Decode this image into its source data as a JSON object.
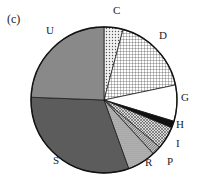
{
  "panel_label": "(c)",
  "chart_data": {
    "type": "pie",
    "title": "",
    "start_angle_deg": 0,
    "direction": "clockwise",
    "slices": [
      {
        "label": "C",
        "value": 4.2,
        "pattern": "dots",
        "fill": "#d9d9d9"
      },
      {
        "label": "D",
        "value": 17.5,
        "pattern": "grid",
        "fill": "#ececec"
      },
      {
        "label": "G",
        "value": 8.0,
        "pattern": "none",
        "fill": "#ffffff"
      },
      {
        "label": "H",
        "value": 1.5,
        "pattern": "solid",
        "fill": "#111111"
      },
      {
        "label": "I",
        "value": 5.0,
        "pattern": "crosshatch",
        "fill": "#bdbdbd"
      },
      {
        "label": "P",
        "value": 2.0,
        "pattern": "diagonal",
        "fill": "#9a9a9a"
      },
      {
        "label": "R",
        "value": 6.3,
        "pattern": "fine-dots",
        "fill": "#a8a8a8"
      },
      {
        "label": "S",
        "value": 31.1,
        "pattern": "dark-texture",
        "fill": "#5e5e5e"
      },
      {
        "label": "U",
        "value": 24.4,
        "pattern": "horizontal-lines",
        "fill": "#8a8a8a"
      }
    ]
  },
  "labels": {
    "C": {
      "x": 113,
      "y": 11
    },
    "D": {
      "x": 159,
      "y": 36
    },
    "G": {
      "x": 181,
      "y": 98
    },
    "H": {
      "x": 176,
      "y": 125
    },
    "I": {
      "x": 176,
      "y": 144
    },
    "P": {
      "x": 167,
      "y": 162
    },
    "R": {
      "x": 145,
      "y": 163
    },
    "S": {
      "x": 53,
      "y": 161
    },
    "U": {
      "x": 46,
      "y": 31
    }
  }
}
